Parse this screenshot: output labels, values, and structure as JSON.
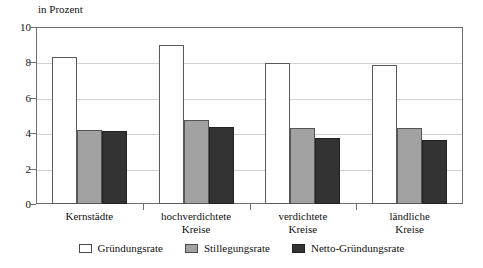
{
  "chart_data": {
    "type": "bar",
    "title": "",
    "subtitle": "",
    "axis_note": "in Prozent",
    "xlabel": "",
    "ylabel": "in Prozent",
    "ylim": [
      0,
      10
    ],
    "yticks": [
      0,
      2,
      4,
      6,
      8,
      10
    ],
    "ytick_labels": [
      "0",
      "2",
      "4",
      "6",
      "8",
      "10"
    ],
    "grid": true,
    "legend_position": "bottom-center",
    "categories": [
      "Kernstädte",
      "hochverdichtete Kreise",
      "verdichtete Kreise",
      "ländliche Kreise"
    ],
    "category_lines": [
      [
        "Kernstädte",
        ""
      ],
      [
        "hochverdichtete",
        "Kreise"
      ],
      [
        "verdichtete",
        "Kreise"
      ],
      [
        "ländliche",
        "Kreise"
      ]
    ],
    "series": [
      {
        "name": "Gründungsrate",
        "color": "#ffffff",
        "values": [
          8.3,
          9.0,
          7.95,
          7.85
        ]
      },
      {
        "name": "Stillegungsrate",
        "color": "#a2a2a2",
        "values": [
          4.2,
          4.75,
          4.3,
          4.3
        ]
      },
      {
        "name": "Netto-Gründungsrate",
        "color": "#333333",
        "values": [
          4.1,
          4.35,
          3.75,
          3.6
        ]
      }
    ]
  },
  "colors": {
    "axis": "#6e6e6e",
    "grid": "#d2d2d2",
    "text": "#111111",
    "series_0": "#ffffff",
    "series_1": "#a2a2a2",
    "series_2": "#333333"
  }
}
